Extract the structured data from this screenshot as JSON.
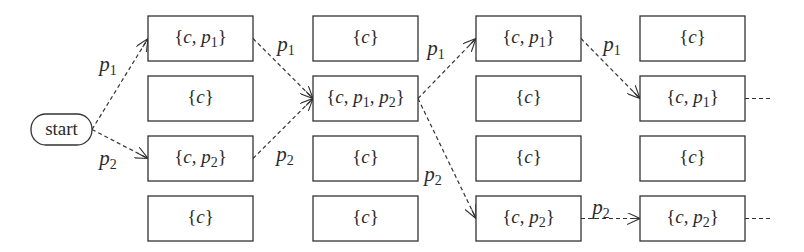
{
  "diagram": {
    "title": "",
    "start": {
      "label": "start",
      "x": 31,
      "y": 114,
      "w": 61,
      "h": 31
    },
    "columns": [
      {
        "x": 148,
        "boxes": [
          {
            "row": 0,
            "set": [
              "c",
              "p1"
            ]
          },
          {
            "row": 1,
            "set": [
              "c"
            ]
          },
          {
            "row": 2,
            "set": [
              "c",
              "p2"
            ]
          },
          {
            "row": 3,
            "set": [
              "c"
            ]
          }
        ]
      },
      {
        "x": 313,
        "boxes": [
          {
            "row": 0,
            "set": [
              "c"
            ]
          },
          {
            "row": 1,
            "set": [
              "c",
              "p1",
              "p2"
            ]
          },
          {
            "row": 2,
            "set": [
              "c"
            ]
          },
          {
            "row": 3,
            "set": [
              "c"
            ]
          }
        ]
      },
      {
        "x": 476,
        "boxes": [
          {
            "row": 0,
            "set": [
              "c",
              "p1"
            ]
          },
          {
            "row": 1,
            "set": [
              "c"
            ]
          },
          {
            "row": 2,
            "set": [
              "c"
            ]
          },
          {
            "row": 3,
            "set": [
              "c",
              "p2"
            ]
          }
        ]
      },
      {
        "x": 640,
        "boxes": [
          {
            "row": 0,
            "set": [
              "c"
            ]
          },
          {
            "row": 1,
            "set": [
              "c",
              "p1"
            ]
          },
          {
            "row": 2,
            "set": [
              "c"
            ]
          },
          {
            "row": 3,
            "set": [
              "c",
              "p2"
            ]
          }
        ]
      }
    ],
    "box_size": {
      "w": 105,
      "h": 45
    },
    "row_tops": [
      16,
      76,
      136,
      196
    ],
    "edges": [
      {
        "from": "start",
        "to": "col0.row0",
        "label": "p1",
        "style": "dashed-arrow"
      },
      {
        "from": "start",
        "to": "col0.row2",
        "label": "p2",
        "style": "dashed-arrow"
      },
      {
        "from": "col0.row0",
        "to": "col1.row1",
        "label": "p1",
        "style": "dashed-arrow"
      },
      {
        "from": "col0.row2",
        "to": "col1.row1",
        "label": "p2",
        "style": "dashed-arrow"
      },
      {
        "from": "col1.row1",
        "to": "col2.row0",
        "label": "p1",
        "style": "dashed-arrow"
      },
      {
        "from": "col1.row1",
        "to": "col2.row3",
        "label": "p2",
        "style": "dashed-arrow"
      },
      {
        "from": "col2.row0",
        "to": "col3.row1",
        "label": "p1",
        "style": "dashed-arrow"
      },
      {
        "from": "col2.row3",
        "to": "col3.row3",
        "label": "p2",
        "style": "dashed-arrow"
      },
      {
        "from": "col3.row1",
        "to": "continues",
        "label": "",
        "style": "dashed-line"
      },
      {
        "from": "col3.row3",
        "to": "continues",
        "label": "",
        "style": "dashed-line"
      }
    ],
    "colors": {
      "stroke": "#333333",
      "text": "#2a2a2a",
      "background": "#ffffff"
    }
  }
}
